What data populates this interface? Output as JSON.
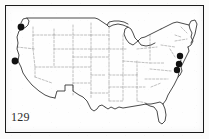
{
  "figure": {
    "number_label": "129",
    "caption": "",
    "region": "Contiguous United States",
    "map_type": "species distribution dot map",
    "frame_color": "#1b1b1b",
    "background_color": "#fefefe",
    "coastline_color": "#2b2b2b",
    "state_boundary_color": "#8c8c8c",
    "dot_color": "#111111"
  },
  "legend": {
    "visible": false,
    "entries": []
  },
  "record_dots": [
    {
      "id": "dot-1",
      "name": "record-dot-pacific-northwest",
      "x": 21,
      "y": 27,
      "r": 3.4,
      "area": "Washington / Oregon border"
    },
    {
      "id": "dot-2",
      "name": "record-dot-northern-california",
      "x": 15,
      "y": 61,
      "r": 3.4,
      "area": "Northern California coast"
    },
    {
      "id": "dot-3",
      "name": "record-dot-new-jersey",
      "x": 180,
      "y": 56,
      "r": 3.2,
      "area": "New Jersey"
    },
    {
      "id": "dot-4",
      "name": "record-dot-delaware",
      "x": 179,
      "y": 64,
      "r": 3.2,
      "area": "Delaware / eastern Maryland"
    },
    {
      "id": "dot-5",
      "name": "record-dot-chesapeake",
      "x": 177,
      "y": 70,
      "r": 3.2,
      "area": "Chesapeake Bay region"
    }
  ],
  "counts": {
    "total_dots": 5,
    "western_dots": 2,
    "eastern_dots": 3
  }
}
